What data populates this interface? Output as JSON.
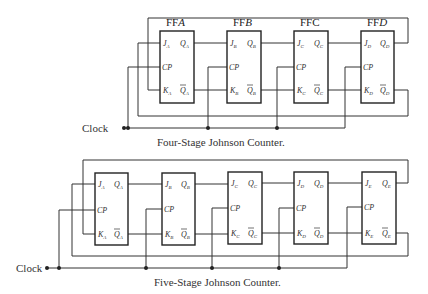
{
  "diagrams": [
    {
      "caption": "Four-Stage Johnson Counter.",
      "clock_label": "Clock",
      "stages": [
        {
          "title": "FF",
          "letter": "A",
          "J": "J",
          "K": "K",
          "Q": "Q",
          "sub": "A",
          "CP": "CP"
        },
        {
          "title": "FF",
          "letter": "B",
          "J": "J",
          "K": "K",
          "Q": "Q",
          "sub": "B",
          "CP": "CP"
        },
        {
          "title": "FF",
          "letter": "C",
          "J": "J",
          "K": "K",
          "Q": "Q",
          "sub": "C",
          "CP": "CP"
        },
        {
          "title": "FF",
          "letter": "D",
          "J": "J",
          "K": "K",
          "Q": "Q",
          "sub": "D",
          "CP": "CP"
        }
      ]
    },
    {
      "caption": "Five-Stage Johnson Counter.",
      "clock_label": "Clock",
      "stages": [
        {
          "J": "J",
          "K": "K",
          "Q": "Q",
          "sub": "A",
          "CP": "CP"
        },
        {
          "J": "J",
          "K": "K",
          "Q": "Q",
          "sub": "B",
          "CP": "CP"
        },
        {
          "J": "J",
          "K": "K",
          "Q": "Q",
          "sub": "C",
          "CP": "CP"
        },
        {
          "J": "J",
          "K": "K",
          "Q": "Q",
          "sub": "D",
          "CP": "CP"
        },
        {
          "J": "J",
          "K": "K",
          "Q": "Q",
          "sub": "E",
          "CP": "CP"
        }
      ]
    }
  ]
}
